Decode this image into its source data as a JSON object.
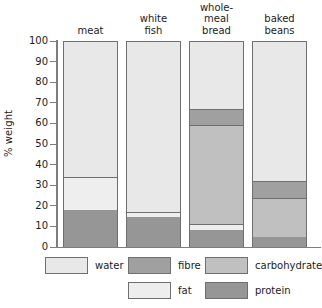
{
  "chart_data": {
    "type": "bar",
    "subtype": "stacked-bar",
    "title": "",
    "xlabel": "",
    "ylabel": "% weight",
    "ylim": [
      0,
      100
    ],
    "ytick_labels": [
      "100",
      "90",
      "80",
      "70",
      "60",
      "50",
      "40",
      "30",
      "20",
      "10",
      "0"
    ],
    "ytick_values": [
      100,
      90,
      80,
      70,
      60,
      50,
      40,
      30,
      20,
      10,
      0
    ],
    "grid": false,
    "legend_position": "bottom",
    "categories": [
      "meat",
      "white fish",
      "whole-meal bread",
      "baked beans"
    ],
    "category_label_lines": [
      [
        "meat"
      ],
      [
        "white",
        "fish"
      ],
      [
        "whole-",
        "meal",
        "bread"
      ],
      [
        "baked",
        "beans"
      ]
    ],
    "stack_order_bottom_to_top": [
      "protein",
      "fat",
      "carbohydrate",
      "fibre",
      "water"
    ],
    "series": [
      {
        "name": "protein",
        "color": "#969696",
        "values": [
          18,
          14.5,
          8.5,
          5
        ]
      },
      {
        "name": "fat",
        "color": "#eeeeee",
        "values": [
          16,
          2.5,
          2.5,
          0
        ]
      },
      {
        "name": "carbohydrate",
        "color": "#c0c0c0",
        "values": [
          0,
          0,
          48,
          19
        ]
      },
      {
        "name": "fibre",
        "color": "#a0a0a0",
        "values": [
          0,
          0,
          8,
          8
        ]
      },
      {
        "name": "water",
        "color": "#e8e8e8",
        "values": [
          66,
          83,
          33,
          68
        ]
      }
    ],
    "boundaries_percent": {
      "meat": [
        18,
        34,
        34,
        34,
        100
      ],
      "white fish": [
        14.5,
        17,
        17,
        17,
        100
      ],
      "whole-meal bread": [
        8.5,
        11,
        59,
        67,
        100
      ],
      "baked beans": [
        5,
        5,
        24,
        32,
        100
      ]
    },
    "legend": [
      {
        "label": "water",
        "color": "#e8e8e8"
      },
      {
        "label": "fibre",
        "color": "#a0a0a0"
      },
      {
        "label": "carbohydrate",
        "color": "#c0c0c0"
      },
      {
        "label": "fat",
        "color": "#eeeeee"
      },
      {
        "label": "protein",
        "color": "#969696"
      }
    ]
  },
  "axis": {
    "y_title": "% weight"
  }
}
